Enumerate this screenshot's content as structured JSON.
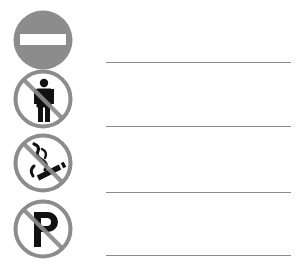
{
  "worksheet": {
    "colors": {
      "sign_gray": "#8c8c8c",
      "symbol_black": "#111111",
      "line_gray": "#8a8a8a",
      "background": "#ffffff"
    },
    "items": [
      {
        "icon": "no-entry-icon",
        "label": "No entry",
        "answer": ""
      },
      {
        "icon": "no-pedestrians-icon",
        "label": "No pedestrians",
        "answer": ""
      },
      {
        "icon": "no-smoking-icon",
        "label": "No smoking",
        "answer": ""
      },
      {
        "icon": "no-parking-icon",
        "label": "No parking",
        "answer": ""
      }
    ]
  }
}
